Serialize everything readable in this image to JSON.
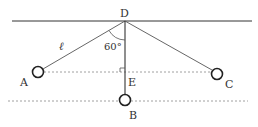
{
  "diagram": {
    "labels": {
      "D": "D",
      "A": "A",
      "B": "B",
      "C": "C",
      "E": "E",
      "length": "ℓ",
      "angle": "60°"
    },
    "points": {
      "D": [
        125,
        21
      ],
      "A": [
        38,
        72
      ],
      "B": [
        125,
        100
      ],
      "C": [
        217,
        73
      ],
      "E": [
        125,
        72
      ]
    },
    "colors": {
      "line": "#333333",
      "dashed": "#888888",
      "circle": "#222222"
    }
  }
}
